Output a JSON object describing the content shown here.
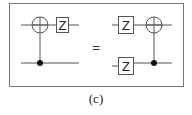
{
  "figure": {
    "caption": "(c)",
    "equals_symbol": "=",
    "gate_label": "Z",
    "colors": {
      "line": "#555555",
      "frame": "#666666",
      "text": "#222222"
    },
    "left_circuit": {
      "description": "CNOT (target on top wire, control on bottom wire) followed by Z on top wire",
      "gates": [
        {
          "type": "cnot-target",
          "wire": 1
        },
        {
          "type": "control-dot",
          "wire": 2
        },
        {
          "type": "Z",
          "wire": 1
        }
      ]
    },
    "right_circuit": {
      "description": "Z on both wires followed by CNOT (target top, control bottom)",
      "gates": [
        {
          "type": "Z",
          "wire": 1
        },
        {
          "type": "Z",
          "wire": 2
        },
        {
          "type": "cnot-target",
          "wire": 1
        },
        {
          "type": "control-dot",
          "wire": 2
        }
      ]
    }
  }
}
